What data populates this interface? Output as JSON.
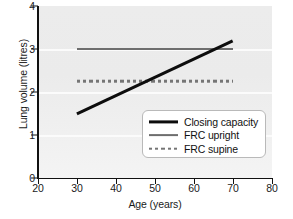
{
  "chart_data": {
    "type": "line",
    "title": "",
    "xlabel": "Age (years)",
    "ylabel": "Lung volume (litres)",
    "xlim": [
      20,
      80
    ],
    "ylim": [
      0,
      4
    ],
    "xticks": [
      20,
      30,
      40,
      50,
      60,
      70,
      80
    ],
    "yticks": [
      0,
      1,
      2,
      3,
      4
    ],
    "grid": true,
    "legend_position": "lower right",
    "series": [
      {
        "name": "Closing capacity",
        "style": "solid-thick",
        "color": "#0d0d0d",
        "x": [
          30,
          70
        ],
        "y": [
          1.5,
          3.2
        ]
      },
      {
        "name": "FRC upright",
        "style": "solid-thin",
        "color": "#6e6e6e",
        "x": [
          30,
          70
        ],
        "y": [
          3.0,
          3.0
        ]
      },
      {
        "name": "FRC supine",
        "style": "dotted",
        "color": "#757575",
        "x": [
          30,
          70
        ],
        "y": [
          2.25,
          2.25
        ]
      }
    ],
    "annotations": []
  },
  "axes": {
    "y": {
      "label": "Lung volume (litres)",
      "ticks": [
        "0",
        "1",
        "2",
        "3",
        "4"
      ]
    },
    "x": {
      "label": "Age (years)",
      "ticks": [
        "20",
        "30",
        "40",
        "50",
        "60",
        "70",
        "80"
      ]
    }
  },
  "legend": {
    "entries": [
      {
        "label": "Closing capacity"
      },
      {
        "label": "FRC upright"
      },
      {
        "label": "FRC supine"
      }
    ]
  }
}
